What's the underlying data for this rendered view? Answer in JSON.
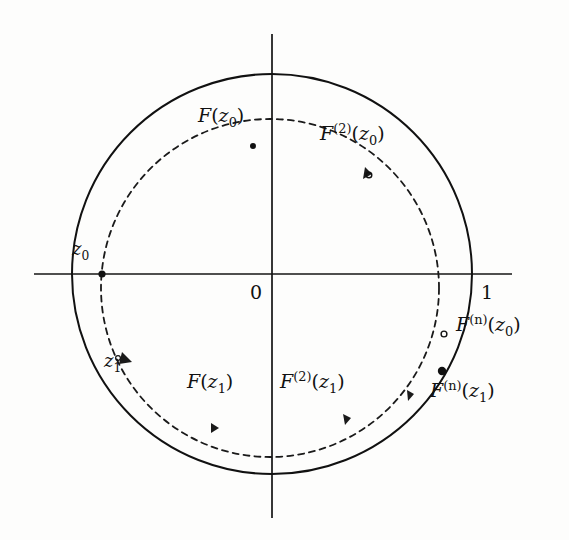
{
  "figure": {
    "background_color": "#fdfdfc",
    "ink_color": "#111111"
  },
  "axes": {
    "origin_label": "0",
    "unit_label": "1",
    "horizontal_axis_name": "real-axis",
    "vertical_axis_name": "imaginary-axis"
  },
  "curves": {
    "outer_circle": {
      "name": "unit-circle",
      "style": "solid",
      "cx": 272,
      "cy": 274,
      "r": 200
    },
    "inner_circle": {
      "name": "orbit-circle",
      "style": "dashed",
      "cx": 270,
      "cy": 288,
      "r": 169
    }
  },
  "labels": [
    {
      "id": "z0",
      "base": "z",
      "sup": "",
      "sub": "0",
      "arg": "",
      "argsub": "",
      "x": 72,
      "y": 249,
      "size": "mid"
    },
    {
      "id": "z1",
      "base": "z",
      "sup": "",
      "sub": "1",
      "arg": "",
      "argsub": "",
      "x": 104,
      "y": 360,
      "size": "mid"
    },
    {
      "id": "Fz0",
      "base": "F",
      "sup": "",
      "sub": "",
      "arg": "z",
      "argsub": "0",
      "x": 198,
      "y": 113,
      "size": "big"
    },
    {
      "id": "F2z0",
      "base": "F",
      "sup": "(2)",
      "sub": "",
      "arg": "z",
      "argsub": "0",
      "x": 320,
      "y": 131,
      "size": "big"
    },
    {
      "id": "Fnz0",
      "base": "F",
      "sup": "(n)",
      "sub": "",
      "arg": "z",
      "argsub": "0",
      "x": 456,
      "y": 322,
      "size": "big"
    },
    {
      "id": "Fz1",
      "base": "F",
      "sup": "",
      "sub": "",
      "arg": "z",
      "argsub": "1",
      "x": 187,
      "y": 379,
      "size": "big"
    },
    {
      "id": "F2z1",
      "base": "F",
      "sup": "(2)",
      "sub": "",
      "arg": "z",
      "argsub": "1",
      "x": 280,
      "y": 379,
      "size": "big"
    },
    {
      "id": "Fnz1",
      "base": "F",
      "sup": "(n)",
      "sub": "",
      "arg": "z",
      "argsub": "1",
      "x": 430,
      "y": 388,
      "size": "big"
    }
  ],
  "label_text": {
    "z0": "z₀",
    "z1": "z₁",
    "Fz0": "F(z₀)",
    "F2z0": "F⁽²⁾(z₀)",
    "Fnz0": "F⁽ⁿ⁾(z₀)",
    "Fz1": "F(z₁)",
    "F2z1": "F⁽²⁾(z₁)",
    "Fnz1": "F⁽ⁿ⁾(z₁)"
  },
  "parts": {
    "F": "F",
    "z": "z",
    "sup2": "(2)",
    "supn": "(n)",
    "sub0": "0",
    "sub1": "1",
    "open_paren": "(",
    "close_paren": ")"
  },
  "marked_points": [
    {
      "name": "point-z0",
      "x": 102,
      "y": 274,
      "filled": true
    },
    {
      "name": "point-Fz0",
      "x": 253,
      "y": 146,
      "filled": true
    },
    {
      "name": "point-F2z0",
      "x": 369,
      "y": 175,
      "filled": false
    },
    {
      "name": "point-Fnz0",
      "x": 444,
      "y": 334,
      "filled": false
    },
    {
      "name": "point-z1",
      "x": 118,
      "y": 358,
      "filled": false
    },
    {
      "name": "point-Fz1",
      "x": 215,
      "y": 427,
      "filled": false
    },
    {
      "name": "point-F2z1",
      "x": 345,
      "y": 420,
      "filled": false
    },
    {
      "name": "point-Fnz1",
      "x": 410,
      "y": 396,
      "filled": false
    },
    {
      "name": "point-fixed",
      "x": 442,
      "y": 371,
      "filled": true
    }
  ]
}
